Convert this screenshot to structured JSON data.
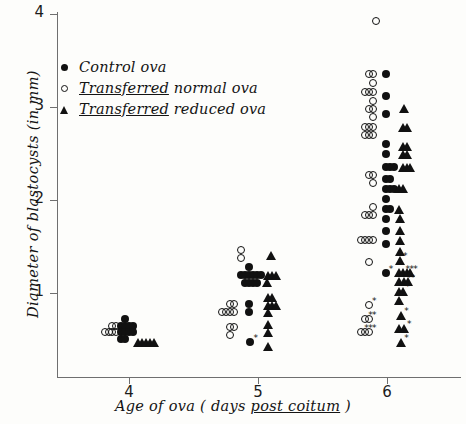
{
  "figure": {
    "width": 466,
    "height": 424,
    "background": "#fdfdfb",
    "ink_color": "#111111",
    "axis_color": "#6f6f6f"
  },
  "legend": {
    "position": "upper-left-inside",
    "entries": [
      {
        "marker": "filled-circle",
        "label": "Control ova",
        "underline": ""
      },
      {
        "marker": "open-circle",
        "label": " normal ova",
        "underline": "Transferred"
      },
      {
        "marker": "filled-triangle",
        "label": " reduced ova",
        "underline": "Transferred"
      }
    ]
  },
  "chart_data": {
    "type": "scatter",
    "title": "",
    "xlabel": "Age of ova (days post coitum)",
    "xlabel_parts": {
      "pre": "Age of ova ( days ",
      "underlined": "post coitum",
      "post": " )"
    },
    "ylabel": "Diameter of blastocysts (in mm)",
    "xlim": [
      3.55,
      6.6
    ],
    "ylim": [
      0.25,
      4.1
    ],
    "xticks": [
      4,
      5,
      6
    ],
    "xtick_labels": [
      "4",
      "5",
      "6"
    ],
    "yticks": [
      1,
      2,
      3,
      4
    ],
    "ytick_labels": [
      "1",
      "2",
      "3",
      "4"
    ],
    "grid": false,
    "legend_position": "upper left",
    "series": [
      {
        "name": "Control ova",
        "marker": "filled-circle",
        "points": [
          [
            3.97,
            0.72
          ],
          [
            3.94,
            0.65
          ],
          [
            3.97,
            0.65
          ],
          [
            4.0,
            0.65
          ],
          [
            4.03,
            0.65
          ],
          [
            3.94,
            0.58
          ],
          [
            3.97,
            0.58
          ],
          [
            4.0,
            0.58
          ],
          [
            4.03,
            0.58
          ],
          [
            3.94,
            0.51
          ],
          [
            3.97,
            0.51
          ],
          [
            4.93,
            1.28
          ],
          [
            4.87,
            1.19
          ],
          [
            4.9,
            1.19
          ],
          [
            4.93,
            1.19
          ],
          [
            4.96,
            1.19
          ],
          [
            4.99,
            1.19
          ],
          [
            5.02,
            1.19
          ],
          [
            4.9,
            1.11
          ],
          [
            4.93,
            1.11
          ],
          [
            4.96,
            1.11
          ],
          [
            4.99,
            1.11
          ],
          [
            4.93,
            0.88
          ],
          [
            4.93,
            0.8
          ],
          [
            4.94,
            0.47
          ],
          [
            5.99,
            3.35
          ],
          [
            5.99,
            3.12
          ],
          [
            5.99,
            2.93
          ],
          [
            5.99,
            2.6
          ],
          [
            5.99,
            2.5
          ],
          [
            5.99,
            2.35
          ],
          [
            6.02,
            2.35
          ],
          [
            6.05,
            2.35
          ],
          [
            5.99,
            2.23
          ],
          [
            6.02,
            2.23
          ],
          [
            5.99,
            2.12
          ],
          [
            6.02,
            2.12
          ],
          [
            6.05,
            2.12
          ],
          [
            5.99,
            2.01
          ],
          [
            5.99,
            1.9
          ],
          [
            6.02,
            1.9
          ],
          [
            5.99,
            1.8
          ],
          [
            5.99,
            1.67
          ],
          [
            5.99,
            1.53
          ],
          [
            5.99,
            1.22
          ]
        ]
      },
      {
        "name": "Transferred normal ova",
        "marker": "open-circle",
        "points": [
          [
            3.87,
            0.65
          ],
          [
            3.9,
            0.65
          ],
          [
            3.81,
            0.58
          ],
          [
            3.84,
            0.58
          ],
          [
            3.87,
            0.58
          ],
          [
            3.9,
            0.58
          ],
          [
            4.87,
            1.46
          ],
          [
            4.87,
            1.38
          ],
          [
            4.78,
            0.88
          ],
          [
            4.81,
            0.88
          ],
          [
            4.72,
            0.8
          ],
          [
            4.75,
            0.8
          ],
          [
            4.78,
            0.8
          ],
          [
            4.81,
            0.8
          ],
          [
            4.78,
            0.63
          ],
          [
            4.81,
            0.63
          ],
          [
            4.78,
            0.55
          ],
          [
            5.91,
            3.92
          ],
          [
            5.86,
            3.35
          ],
          [
            5.89,
            3.35
          ],
          [
            5.89,
            3.26
          ],
          [
            5.83,
            3.16
          ],
          [
            5.86,
            3.16
          ],
          [
            5.89,
            3.16
          ],
          [
            5.89,
            3.07
          ],
          [
            5.86,
            2.98
          ],
          [
            5.89,
            2.98
          ],
          [
            5.89,
            2.89
          ],
          [
            5.83,
            2.79
          ],
          [
            5.86,
            2.79
          ],
          [
            5.89,
            2.79
          ],
          [
            5.83,
            2.7
          ],
          [
            5.86,
            2.7
          ],
          [
            5.89,
            2.7
          ],
          [
            5.86,
            2.27
          ],
          [
            5.89,
            2.27
          ],
          [
            5.89,
            2.18
          ],
          [
            5.89,
            1.93
          ],
          [
            5.83,
            1.84
          ],
          [
            5.86,
            1.84
          ],
          [
            5.89,
            1.84
          ],
          [
            5.8,
            1.57
          ],
          [
            5.83,
            1.57
          ],
          [
            5.86,
            1.57
          ],
          [
            5.89,
            1.57
          ],
          [
            5.86,
            1.33
          ],
          [
            5.86,
            0.87
          ],
          [
            5.83,
            0.72
          ],
          [
            5.86,
            0.72
          ],
          [
            5.8,
            0.58
          ],
          [
            5.83,
            0.58
          ],
          [
            5.86,
            0.58
          ]
        ],
        "starred_points": [
          [
            5.86,
            0.87
          ],
          [
            5.83,
            0.72
          ],
          [
            5.86,
            0.72
          ],
          [
            5.8,
            0.58
          ],
          [
            5.83,
            0.58
          ],
          [
            5.86,
            0.58
          ]
        ]
      },
      {
        "name": "Transferred reduced ova",
        "marker": "filled-triangle",
        "points": [
          [
            4.07,
            0.47
          ],
          [
            4.1,
            0.47
          ],
          [
            4.13,
            0.47
          ],
          [
            4.16,
            0.47
          ],
          [
            4.19,
            0.47
          ],
          [
            5.1,
            1.4
          ],
          [
            5.08,
            1.19
          ],
          [
            5.11,
            1.19
          ],
          [
            5.14,
            1.19
          ],
          [
            5.07,
            1.11
          ],
          [
            5.08,
            0.95
          ],
          [
            5.11,
            0.95
          ],
          [
            5.08,
            0.87
          ],
          [
            5.11,
            0.87
          ],
          [
            5.14,
            0.87
          ],
          [
            5.08,
            0.79
          ],
          [
            5.08,
            0.66
          ],
          [
            5.08,
            0.58
          ],
          [
            5.08,
            0.43
          ],
          [
            6.13,
            2.98
          ],
          [
            6.12,
            2.78
          ],
          [
            6.15,
            2.78
          ],
          [
            6.12,
            2.58
          ],
          [
            6.15,
            2.58
          ],
          [
            6.12,
            2.49
          ],
          [
            6.15,
            2.49
          ],
          [
            6.12,
            2.35
          ],
          [
            6.15,
            2.35
          ],
          [
            6.18,
            2.35
          ],
          [
            6.09,
            2.12
          ],
          [
            6.12,
            2.12
          ],
          [
            6.09,
            1.9
          ],
          [
            6.1,
            1.8
          ],
          [
            6.1,
            1.67
          ],
          [
            6.1,
            1.56
          ],
          [
            6.1,
            1.45
          ],
          [
            6.1,
            1.35
          ],
          [
            6.09,
            1.22
          ],
          [
            6.12,
            1.22
          ],
          [
            6.15,
            1.22
          ],
          [
            6.18,
            1.22
          ],
          [
            6.09,
            1.12
          ],
          [
            6.13,
            1.12
          ],
          [
            6.16,
            1.12
          ],
          [
            6.09,
            1.02
          ],
          [
            6.12,
            1.02
          ],
          [
            6.09,
            0.92
          ],
          [
            6.11,
            0.76
          ],
          [
            6.09,
            0.62
          ],
          [
            6.13,
            0.62
          ],
          [
            6.11,
            0.47
          ]
        ],
        "starred_points": [
          [
            6.1,
            1.35
          ],
          [
            6.12,
            1.22
          ],
          [
            6.15,
            1.22
          ],
          [
            6.18,
            1.22
          ],
          [
            6.13,
            1.12
          ],
          [
            6.16,
            1.12
          ],
          [
            6.12,
            1.02
          ],
          [
            6.09,
            0.92
          ],
          [
            6.11,
            0.76
          ],
          [
            6.13,
            0.62
          ],
          [
            6.11,
            0.47
          ]
        ]
      }
    ],
    "extra_starred_markers": [
      {
        "series": "Control ova",
        "point": [
          4.94,
          0.47
        ]
      },
      {
        "series": "Control ova",
        "point": [
          5.99,
          1.22
        ]
      }
    ]
  }
}
